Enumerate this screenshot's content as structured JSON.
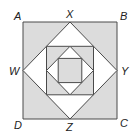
{
  "diagram": {
    "type": "nested-squares",
    "labels": {
      "A": "A",
      "B": "B",
      "C": "C",
      "D": "D",
      "W": "W",
      "X": "X",
      "Y": "Y",
      "Z": "Z"
    },
    "colors": {
      "shaded": "#dcdcdc",
      "unshaded": "#ffffff",
      "stroke": "#4a4a4a"
    }
  }
}
